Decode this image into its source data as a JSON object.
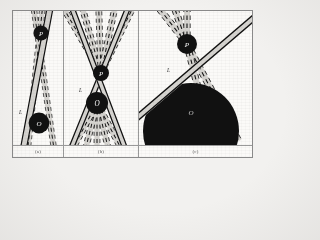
{
  "figure": {
    "background_color": "#fbfaf8",
    "page_color": "#f2f1ef",
    "border_color": "#8a8a8a",
    "band_fill_color": "#d6d4d0",
    "band_edge_color": "#1a1a1a",
    "body_color": "#111111",
    "label_color": "#2b2b2b"
  },
  "panels": [
    {
      "id": "a",
      "caption": "(a)",
      "labels": {
        "line_label": "L",
        "upper_body": "P",
        "lower_body": "O"
      },
      "description": "Two near-parallel straight bands crossing at a shallow angle; small dark disc P near top, larger dark disc O near bottom; dashed band pair flanks the solid band."
    },
    {
      "id": "b",
      "caption": "(b)",
      "labels": {
        "line_label": "L",
        "upper_body": "P",
        "lower_body": "O"
      },
      "description": "Fan of dashed bands radiating from an upper convergence point through disc P and disc O, with two solid bands crossing in an X through both discs."
    },
    {
      "id": "c",
      "caption": "(c)",
      "labels": {
        "line_label": "L",
        "upper_body": "P",
        "lower_body": "O"
      },
      "description": "Large filled dark circular body O occupying the lower half; small disc P above it; dashed fan bands converge on P while a broad solid band passes obliquely across the field."
    }
  ],
  "geometry": {
    "panel_a": {
      "solid_band": {
        "x1": 36,
        "y1": -6,
        "x2": 10,
        "y2": 142,
        "width": 3.4
      },
      "dashed_bands": [
        {
          "x1": 28,
          "y1": -6,
          "x2": 16,
          "y2": 142,
          "width": 2.6
        },
        {
          "x1": 18,
          "y1": -6,
          "x2": 40,
          "y2": 142,
          "width": 2.6
        }
      ],
      "bodies": [
        {
          "label": "P",
          "cx": 28,
          "cy": 22,
          "r": 7.5
        },
        {
          "label": "O",
          "cx": 26,
          "cy": 112,
          "r": 10.5
        }
      ],
      "line_label_pos": {
        "x": 8,
        "y": 102
      }
    },
    "panel_b": {
      "convergence_upper": {
        "x": 37,
        "y": 62
      },
      "convergence_lower": {
        "x": 33,
        "y": 92
      },
      "bodies": [
        {
          "label": "P",
          "cx": 37,
          "cy": 62,
          "r": 8
        },
        {
          "label": "O",
          "cx": 33,
          "cy": 92,
          "r": 11
        }
      ],
      "fan_top_angles_deg": [
        -72,
        -58,
        -44,
        -30,
        -14
      ],
      "fan_bottom_angles_deg": [
        250,
        262,
        274,
        286,
        298
      ],
      "line_label_pos": {
        "x": 16,
        "y": 80
      }
    },
    "panel_c": {
      "body_large": {
        "label": "O",
        "cx": 52,
        "cy": 118,
        "r": 48
      },
      "body_small": {
        "label": "P",
        "cx": 48,
        "cy": 33,
        "r": 10
      },
      "fan_angles_deg": [
        -128,
        -108,
        -88
      ],
      "solid_band": {
        "x1": -4,
        "y1": 108,
        "x2": 112,
        "y2": 8,
        "width": 5.5
      },
      "line_label_pos": {
        "x": 30,
        "y": 60
      }
    }
  }
}
